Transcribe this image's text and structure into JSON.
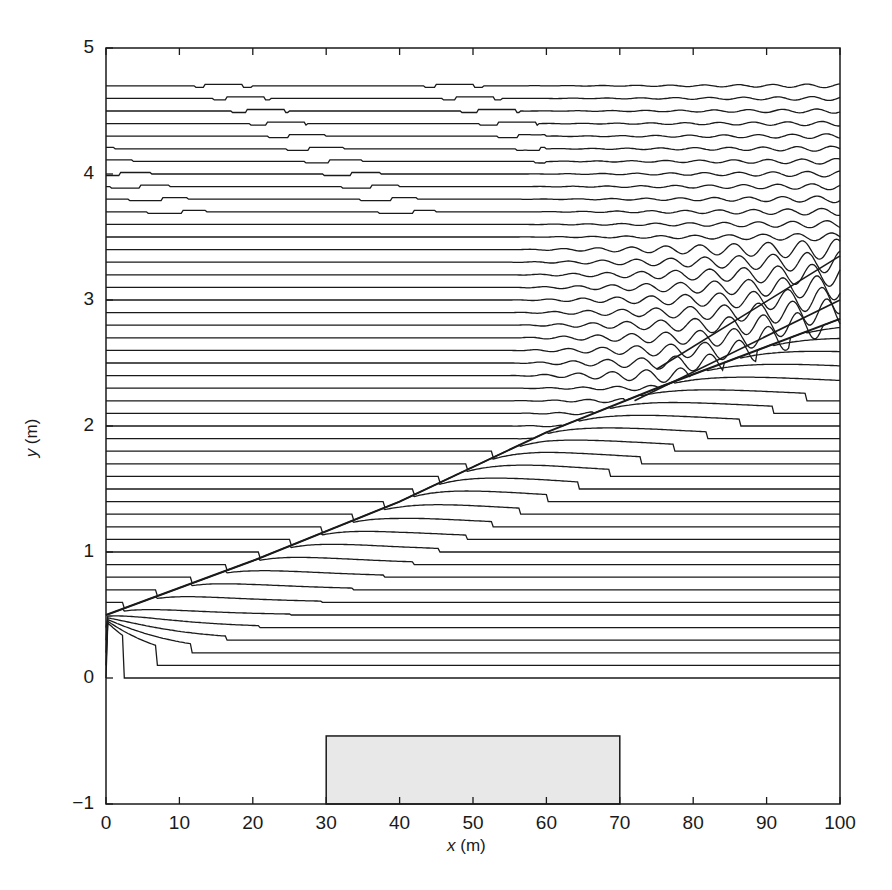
{
  "chart_data": {
    "type": "line",
    "title": "",
    "xlabel": "x (m)",
    "xlabel_var": "x",
    "xlabel_unit": "(m)",
    "ylabel": "y (m)",
    "ylabel_var": "y",
    "ylabel_unit": "(m)",
    "xlim": [
      0,
      100
    ],
    "ylim": [
      -1,
      5
    ],
    "xticks": [
      0,
      10,
      20,
      30,
      40,
      50,
      60,
      70,
      80,
      90,
      100
    ],
    "yticks": [
      -1,
      0,
      1,
      2,
      3,
      4,
      5
    ],
    "ytick_labels": [
      "−1",
      "0",
      "1",
      "2",
      "3",
      "4",
      "5"
    ],
    "grid": false,
    "legend": null,
    "traces": {
      "y_start": 0.0,
      "y_end": 4.7,
      "y_step": 0.1,
      "x_range": [
        0,
        100
      ],
      "color": "#1a1a1a"
    },
    "caustic": {
      "points": [
        [
          0,
          0.5
        ],
        [
          20,
          0.93
        ],
        [
          40,
          1.4
        ],
        [
          60,
          1.95
        ],
        [
          75,
          2.3
        ],
        [
          100,
          2.85
        ]
      ]
    },
    "secondary_fronts": [
      {
        "points": [
          [
            72,
            2.2
          ],
          [
            100,
            3.0
          ]
        ]
      },
      {
        "points": [
          [
            75,
            2.45
          ],
          [
            100,
            3.35
          ]
        ]
      }
    ],
    "obstacle": {
      "x": [
        30,
        70
      ],
      "y": [
        -1,
        -0.46
      ],
      "fill": "#e8e8e8",
      "stroke": "#1a1a1a"
    }
  },
  "colors": {
    "axis": "#1a1a1a",
    "trace": "#1a1a1a",
    "background": "#ffffff",
    "obstacle_fill": "#e8e8e8"
  }
}
